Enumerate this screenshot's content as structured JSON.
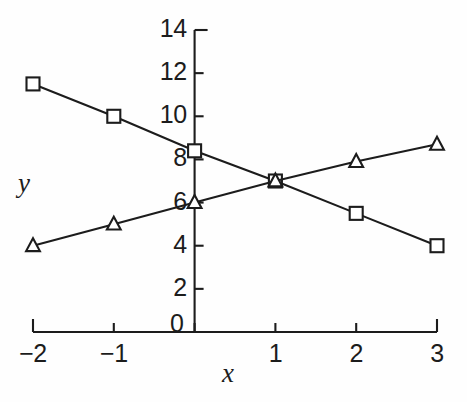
{
  "chart_data": {
    "type": "line",
    "title": "",
    "subtitle": "",
    "xlabel": "x",
    "ylabel": "y",
    "xlim": [
      -2,
      3
    ],
    "ylim": [
      0,
      14
    ],
    "grid": false,
    "legend": "none",
    "x": [
      -2,
      -1,
      0,
      1,
      2,
      3
    ],
    "xtick_labels": [
      "−2",
      "−1",
      "0",
      "1",
      "2",
      "3"
    ],
    "ytick_values": [
      0,
      2,
      4,
      6,
      8,
      10,
      12,
      14
    ],
    "ytick_labels": [
      "0",
      "2",
      "4",
      "6",
      "8",
      "10",
      "12",
      "14"
    ],
    "series": [
      {
        "name": "decreasing-line",
        "marker": "square",
        "marker_fill": "#ffffff",
        "color": "#1c1c1c",
        "values": [
          11.5,
          10.0,
          8.4,
          7.0,
          5.5,
          4.0
        ]
      },
      {
        "name": "increasing-line",
        "marker": "triangle",
        "marker_fill": "#ffffff",
        "color": "#1c1c1c",
        "values": [
          4.0,
          5.0,
          6.0,
          7.0,
          7.9,
          8.7
        ]
      }
    ],
    "annotations": []
  },
  "axes": {
    "y_axis_name": "y-axis",
    "x_axis_name": "x-axis"
  }
}
